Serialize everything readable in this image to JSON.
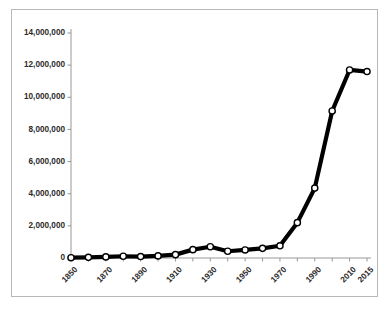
{
  "chart_data": {
    "type": "line",
    "title": "",
    "subtitle": "",
    "xlabel": "",
    "ylabel": "",
    "x": [
      1850,
      1860,
      1870,
      1880,
      1890,
      1900,
      1910,
      1920,
      1930,
      1940,
      1950,
      1960,
      1970,
      1980,
      1990,
      2000,
      2010,
      2015
    ],
    "categories": [
      "1850",
      "1860",
      "1870",
      "1880",
      "1890",
      "1900",
      "1910",
      "1920",
      "1930",
      "1940",
      "1950",
      "1960",
      "1970",
      "1980",
      "1990",
      "2000",
      "2010",
      "2015"
    ],
    "values": [
      20000,
      40000,
      70000,
      110000,
      90000,
      130000,
      210000,
      520000,
      700000,
      420000,
      500000,
      600000,
      760000,
      2200000,
      4350000,
      9150000,
      11700000,
      11600000
    ],
    "series": [
      {
        "name": "series-1",
        "values": [
          20000,
          40000,
          70000,
          110000,
          90000,
          130000,
          210000,
          520000,
          700000,
          420000,
          500000,
          600000,
          760000,
          2200000,
          4350000,
          9150000,
          11700000,
          11600000
        ],
        "color": "#000000",
        "marker": "circle-open"
      }
    ],
    "x_tick_labels": [
      "1850",
      "",
      "1870",
      "",
      "1890",
      "",
      "1910",
      "",
      "1930",
      "",
      "1950",
      "",
      "1970",
      "",
      "1990",
      "",
      "2010",
      "2015"
    ],
    "y_tick_labels": [
      "0",
      "2,000,000",
      "4,000,000",
      "6,000,000",
      "8,000,000",
      "10,000,000",
      "12,000,000",
      "14,000,000"
    ],
    "y_tick_values": [
      0,
      2000000,
      4000000,
      6000000,
      8000000,
      10000000,
      12000000,
      14000000
    ],
    "ylim": [
      0,
      14000000
    ],
    "grid": false,
    "legend": false,
    "legend_position": "none",
    "axis_color": "#8c8c8c",
    "border_color": "#b8b8b8",
    "background": "#ffffff",
    "annotations": []
  }
}
